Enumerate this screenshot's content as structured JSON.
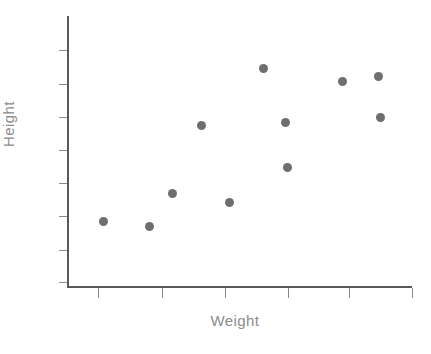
{
  "figure": {
    "background_color": "#ffffff",
    "width": 431,
    "height": 354
  },
  "chart_data": {
    "type": "scatter",
    "title": "",
    "subtitle": "",
    "xlabel": "Weight",
    "ylabel": "Height",
    "grid": false,
    "legend": null,
    "annotations": [],
    "marker": {
      "shape": "circle",
      "color": "#6e6e6e",
      "size_px": 9
    },
    "axis_color": "#595959",
    "tick_color": "#8a8a8a",
    "label_color": "#8c8c8c",
    "xticklabels": [],
    "yticklabels": [],
    "x_tick_count": 6,
    "y_tick_count": 8,
    "xlim": [
      0,
      1
    ],
    "ylim": [
      0,
      1
    ],
    "note": "Unlabeled axes; values below are normalized 0-1 read off tick geometry.",
    "x": [
      0.1,
      0.24,
      0.3,
      0.39,
      0.47,
      0.57,
      0.63,
      0.64,
      0.8,
      0.9,
      0.91
    ],
    "y": [
      0.24,
      0.22,
      0.35,
      0.6,
      0.31,
      0.81,
      0.61,
      0.44,
      0.76,
      0.78,
      0.63
    ],
    "points_px": [
      {
        "cx": 103,
        "cy": 221
      },
      {
        "cx": 149,
        "cy": 226
      },
      {
        "cx": 172,
        "cy": 193
      },
      {
        "cx": 201,
        "cy": 125
      },
      {
        "cx": 229,
        "cy": 202
      },
      {
        "cx": 263,
        "cy": 68
      },
      {
        "cx": 285,
        "cy": 122
      },
      {
        "cx": 287,
        "cy": 167
      },
      {
        "cx": 342,
        "cy": 81
      },
      {
        "cx": 378,
        "cy": 76
      },
      {
        "cx": 380,
        "cy": 117
      }
    ],
    "x_ticks_px": [
      98,
      162,
      225,
      288,
      349,
      412
    ],
    "y_ticks_px": [
      50,
      84,
      117,
      150,
      183,
      216,
      250,
      282
    ]
  }
}
